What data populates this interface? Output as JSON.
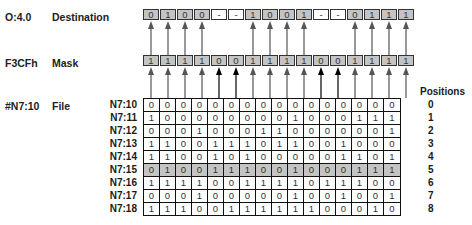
{
  "labels": {
    "destination_addr": "O:4.0",
    "destination_name": "Destination",
    "mask_addr": "F3CFh",
    "mask_name": "Mask",
    "file_addr": "#N7:10",
    "file_name": "File",
    "positions_header": "Positions"
  },
  "destination_bits": [
    "0",
    "1",
    "0",
    "0",
    "-",
    "-",
    "1",
    "0",
    "0",
    "1",
    "-",
    "-",
    "0",
    "1",
    "1",
    "1"
  ],
  "mask_bits": [
    "1",
    "1",
    "1",
    "1",
    "0",
    "0",
    "1",
    "1",
    "1",
    "1",
    "0",
    "0",
    "1",
    "1",
    "1",
    "1"
  ],
  "file_rows": [
    {
      "addr": "N7:10",
      "position": "0",
      "bits": [
        "0",
        "0",
        "0",
        "0",
        "0",
        "0",
        "0",
        "0",
        "0",
        "0",
        "0",
        "0",
        "0",
        "0",
        "0",
        "0"
      ]
    },
    {
      "addr": "N7:11",
      "position": "1",
      "bits": [
        "1",
        "0",
        "0",
        "0",
        "0",
        "0",
        "0",
        "0",
        "0",
        "1",
        "0",
        "0",
        "0",
        "1",
        "1",
        "1"
      ]
    },
    {
      "addr": "N7:12",
      "position": "2",
      "bits": [
        "0",
        "0",
        "0",
        "1",
        "0",
        "0",
        "0",
        "1",
        "1",
        "0",
        "0",
        "0",
        "0",
        "0",
        "0",
        "1"
      ]
    },
    {
      "addr": "N7:13",
      "position": "3",
      "bits": [
        "1",
        "1",
        "0",
        "0",
        "1",
        "1",
        "1",
        "0",
        "1",
        "1",
        "0",
        "0",
        "1",
        "0",
        "0",
        "0"
      ]
    },
    {
      "addr": "N7:14",
      "position": "4",
      "bits": [
        "1",
        "1",
        "0",
        "0",
        "1",
        "0",
        "1",
        "0",
        "0",
        "0",
        "0",
        "0",
        "1",
        "1",
        "0",
        "1"
      ]
    },
    {
      "addr": "N7:15",
      "position": "5",
      "bits": [
        "0",
        "1",
        "0",
        "0",
        "1",
        "1",
        "1",
        "0",
        "0",
        "1",
        "0",
        "0",
        "0",
        "1",
        "1",
        "1"
      ],
      "highlighted": true
    },
    {
      "addr": "N7:16",
      "position": "6",
      "bits": [
        "1",
        "1",
        "1",
        "1",
        "0",
        "0",
        "1",
        "1",
        "1",
        "1",
        "0",
        "1",
        "1",
        "1",
        "0",
        "0"
      ]
    },
    {
      "addr": "N7:17",
      "position": "7",
      "bits": [
        "0",
        "0",
        "0",
        "1",
        "0",
        "0",
        "0",
        "0",
        "0",
        "1",
        "0",
        "0",
        "1",
        "0",
        "0",
        "1"
      ]
    },
    {
      "addr": "N7:18",
      "position": "8",
      "bits": [
        "1",
        "1",
        "1",
        "0",
        "0",
        "1",
        "1",
        "1",
        "1",
        "1",
        "1",
        "0",
        "0",
        "0",
        "1",
        "0"
      ]
    }
  ],
  "colors": {
    "register_fill": "#c4c4c4",
    "highlight_row": "#c4c4c4",
    "arrow_gray": "#555555",
    "arrow_black": "#000000"
  }
}
